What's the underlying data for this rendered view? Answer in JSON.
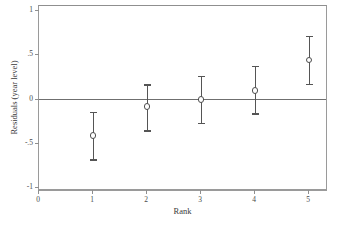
{
  "chart_data": {
    "type": "scatter",
    "title": "",
    "subtitle": "",
    "xlabel": "Rank",
    "ylabel": "Residuals (year level)",
    "xlim": [
      0,
      5.35
    ],
    "ylim": [
      -1.05,
      1.05
    ],
    "grid": false,
    "legend": null,
    "reference_lines": [
      {
        "orientation": "horizontal",
        "value": 0
      }
    ],
    "x_ticks": [
      0,
      1,
      2,
      3,
      4,
      5
    ],
    "x_tick_labels": [
      "0",
      "1",
      "2",
      "3",
      "4",
      "5"
    ],
    "y_ticks": [
      1,
      0.5,
      0,
      -0.5,
      -1
    ],
    "y_tick_labels": [
      "1",
      ".5",
      "0",
      "-.5",
      "-1"
    ],
    "marker_style": "open-circle",
    "error_bar_style": "capped-whisker",
    "series": [
      {
        "name": "Residuals with 95% CI",
        "x": [
          1,
          2,
          3,
          4,
          5
        ],
        "values": [
          -0.42,
          -0.09,
          -0.01,
          0.09,
          0.44
        ],
        "ci_lower": [
          -0.69,
          -0.36,
          -0.28,
          -0.17,
          0.17
        ],
        "ci_upper": [
          -0.15,
          0.16,
          0.26,
          0.37,
          0.71
        ]
      }
    ],
    "points": [
      {
        "rank": "1",
        "estimate": "-0.42",
        "lower": "-0.69",
        "upper": "-0.15"
      },
      {
        "rank": "2",
        "estimate": "-0.09",
        "lower": "-0.36",
        "upper": "0.16"
      },
      {
        "rank": "3",
        "estimate": "-0.01",
        "lower": "-0.28",
        "upper": "0.26"
      },
      {
        "rank": "4",
        "estimate": "0.09",
        "lower": "-0.17",
        "upper": "0.37"
      },
      {
        "rank": "5",
        "estimate": "0.44",
        "lower": "0.17",
        "upper": "0.71"
      }
    ],
    "colors": {
      "marker": "#4d4d4d",
      "whisker": "#555555",
      "frame": "#9a9a9a",
      "reference_line": "#6f6f6f",
      "background": "#ffffff",
      "text": "#3a3a3a"
    }
  }
}
